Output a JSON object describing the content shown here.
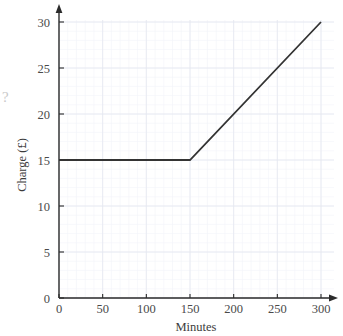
{
  "chart_data": {
    "type": "line",
    "title": "",
    "xlabel": "Minutes",
    "ylabel": "Charge (£)",
    "xlim": [
      0,
      300
    ],
    "ylim": [
      0,
      30
    ],
    "xticks": [
      0,
      50,
      100,
      150,
      200,
      250,
      300
    ],
    "yticks": [
      0,
      5,
      10,
      15,
      20,
      25,
      30
    ],
    "xtick_labels": [
      "0",
      "50",
      "100",
      "150",
      "200",
      "250",
      "300"
    ],
    "ytick_labels": [
      "0",
      "5",
      "10",
      "15",
      "20",
      "25",
      "30"
    ],
    "grid": true,
    "grid_minor": true,
    "legend": null,
    "series": [
      {
        "name": "Charge",
        "x": [
          0,
          150,
          300
        ],
        "values": [
          15,
          15,
          30
        ],
        "color": "#333333"
      }
    ],
    "annotations": []
  },
  "colors": {
    "line": "#333333",
    "axis": "#2b2b2b",
    "grid_major": "#e3e6ef",
    "grid_minor": "#f0f2f8",
    "text": "#4a4a4a",
    "background": "#ffffff"
  },
  "stray": {
    "glyph": "?"
  }
}
